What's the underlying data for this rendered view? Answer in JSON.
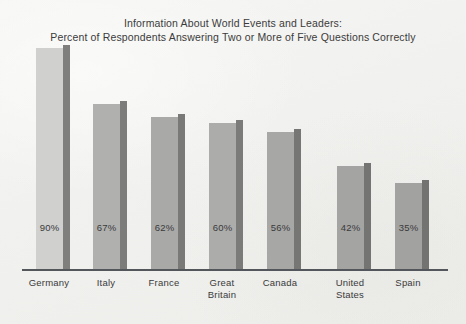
{
  "chart_data": {
    "type": "bar",
    "title": "Information About World Events and Leaders:\nPercent of Respondents Answering Two or More of Five Questions Correctly",
    "title_lines": [
      "Information About World Events and Leaders:",
      "Percent of Respondents Answering Two or More of Five Questions Correctly"
    ],
    "categories": [
      "Germany",
      "Italy",
      "France",
      "Great Britain",
      "Canada",
      "United States",
      "Spain"
    ],
    "category_lines": [
      [
        "Germany"
      ],
      [
        "Italy"
      ],
      [
        "France"
      ],
      [
        "Great",
        "Britain"
      ],
      [
        "Canada"
      ],
      [
        "United",
        "States"
      ],
      [
        "Spain"
      ]
    ],
    "values": [
      90,
      67,
      62,
      60,
      56,
      42,
      35
    ],
    "value_labels": [
      "90%",
      "67%",
      "62%",
      "60%",
      "56%",
      "42%",
      "35%"
    ],
    "xlabel": "",
    "ylabel": "",
    "ylim": [
      0,
      100
    ],
    "grid": false,
    "legend": "none",
    "bar_colors": [
      "#d0d0cf",
      "#b0b0af",
      "#a9a9a8",
      "#acacab",
      "#a7a7a6",
      "#a4a4a3",
      "#a2a2a1"
    ],
    "bar_side_colors": [
      "#7f7f7e",
      "#7c7c7b",
      "#797978",
      "#7b7b7a",
      "#767675",
      "#747473",
      "#737372"
    ],
    "axis_color": "#53565a",
    "background_color": "#f3f3f1",
    "text_color": "#3a3a3a"
  },
  "layout": {
    "bar_lefts": [
      36,
      93,
      151,
      209,
      267,
      337,
      395
    ],
    "bar_width": 27,
    "bar_heights": [
      221,
      165,
      152,
      146,
      137,
      103,
      86
    ],
    "label_centers": [
      49,
      106,
      164,
      222,
      280,
      350,
      408
    ],
    "label_width": 70
  }
}
